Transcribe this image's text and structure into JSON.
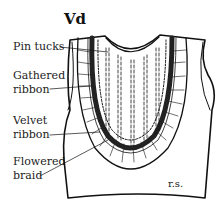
{
  "figure": {
    "title": "Vd",
    "side_note": "r.s.",
    "labels": [
      {
        "id": "pin-tucks",
        "text": "Pin tucks"
      },
      {
        "id": "gathered-ribbon",
        "line1": "Gathered",
        "line2": "ribbon"
      },
      {
        "id": "velvet-ribbon",
        "line1": "Velvet",
        "line2": "ribbon"
      },
      {
        "id": "flowered-braid",
        "line1": "Flowered",
        "line2": "braid"
      }
    ]
  }
}
